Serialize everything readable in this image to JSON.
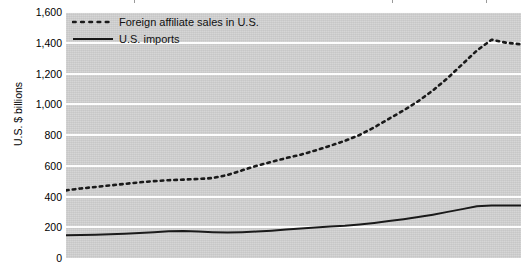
{
  "chart_data": {
    "type": "line",
    "title": "",
    "subtitle": "",
    "xlabel": "",
    "ylabel": "U.S. $ billions",
    "ylim": [
      0,
      1600
    ],
    "y_ticks": [
      0,
      200,
      400,
      600,
      800,
      1000,
      1200,
      1400,
      1600
    ],
    "y_tick_labels": [
      "0",
      "200",
      "400",
      "600",
      "800",
      "1,000",
      "1,200",
      "1,400",
      "1,600"
    ],
    "grid": true,
    "grid_axis": "y",
    "legend_position": "top-left-inside",
    "x_tick_labels": [],
    "x_index": [
      0,
      1,
      2,
      3,
      4,
      5,
      6,
      7,
      8,
      9,
      10,
      11,
      12,
      13,
      14,
      15,
      16,
      17,
      18,
      19,
      20,
      21,
      22,
      23,
      24,
      25,
      26,
      27,
      28,
      29,
      30
    ],
    "series": [
      {
        "name": "Foreign affiliate sales in U.S.",
        "style": "dotted",
        "color": "#1a1a1a",
        "values": [
          440,
          452,
          462,
          472,
          482,
          492,
          500,
          506,
          510,
          514,
          520,
          540,
          570,
          600,
          625,
          650,
          672,
          700,
          730,
          762,
          800,
          850,
          905,
          960,
          1020,
          1090,
          1170,
          1260,
          1350,
          1420,
          1400,
          1390
        ]
      },
      {
        "name": "U.S. imports",
        "style": "solid",
        "color": "#1a1a1a",
        "values": [
          148,
          150,
          152,
          155,
          158,
          162,
          168,
          174,
          176,
          172,
          168,
          166,
          168,
          172,
          178,
          185,
          192,
          198,
          205,
          210,
          218,
          228,
          240,
          252,
          266,
          282,
          300,
          318,
          336,
          342,
          342,
          342
        ]
      }
    ]
  },
  "legend": {
    "items": [
      {
        "label": "Foreign affiliate sales in U.S.",
        "style": "dotted"
      },
      {
        "label": "U.S. imports",
        "style": "solid"
      }
    ]
  },
  "colors": {
    "plot_background": "#d2d2d2",
    "gridline": "#fdfdfd",
    "line": "#1a1a1a",
    "page_background": "#ffffff",
    "text": "#000000"
  }
}
